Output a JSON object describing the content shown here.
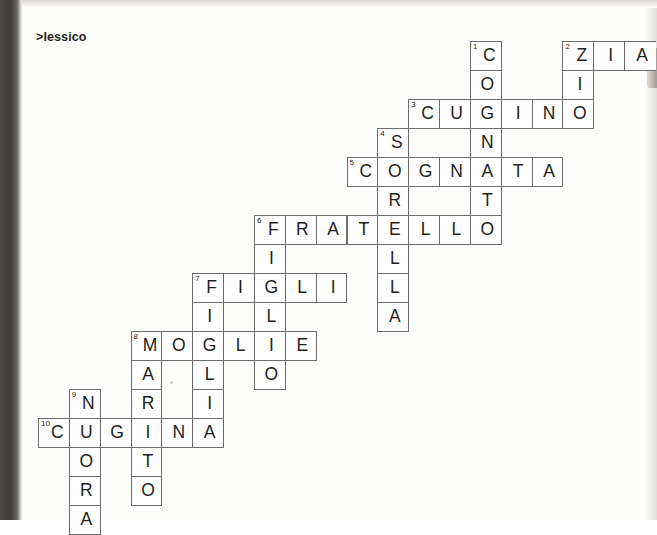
{
  "page": {
    "heading": ">lessico",
    "background_color": "#ffffff",
    "ink_color": "#231f20",
    "cell_border_color": "#6d6d6d"
  },
  "crossword": {
    "cell_width": 30.85,
    "cell_height": 29,
    "origin_x": 38,
    "origin_y": 41,
    "columns": 20,
    "rows": 17,
    "across_entries": [
      {
        "number": "2",
        "answer": "ZIA",
        "row": 0,
        "col": 17,
        "clipped_right": true
      },
      {
        "number": "3",
        "answer": "CUGINO",
        "row": 2,
        "col": 12
      },
      {
        "number": "5",
        "answer": "COGNATA",
        "row": 4,
        "col": 10
      },
      {
        "number": "6",
        "answer": "FRATELLO",
        "row": 6,
        "col": 7
      },
      {
        "number": "7",
        "answer": "FIGLI",
        "row": 8,
        "col": 5
      },
      {
        "number": "8",
        "answer": "MOGLIE",
        "row": 10,
        "col": 3
      },
      {
        "number": "10",
        "answer": "CUGINA",
        "row": 13,
        "col": 0
      }
    ],
    "down_entries": [
      {
        "number": "1",
        "answer": "COGNATO",
        "row": 0,
        "col": 14
      },
      {
        "number": "2",
        "answer": "ZIO",
        "row": 0,
        "col": 17
      },
      {
        "number": "4",
        "answer": "SORELLA",
        "row": 3,
        "col": 11
      },
      {
        "number": "6",
        "answer": "FIGLIA",
        "row": 6,
        "col": 7
      },
      {
        "number": "7",
        "answer": "FIGLIO",
        "row": 8,
        "col": 7
      },
      {
        "number": "8",
        "answer": "MARITO",
        "row": 10,
        "col": 3
      },
      {
        "number": "9",
        "answer": "NUORA",
        "row": 12,
        "col": 1
      }
    ],
    "cells": [
      {
        "row": 0,
        "col": 14,
        "letter": "C",
        "number": "1"
      },
      {
        "row": 0,
        "col": 17,
        "letter": "Z",
        "number": "2"
      },
      {
        "row": 0,
        "col": 18,
        "letter": "I"
      },
      {
        "row": 0,
        "col": 19,
        "letter": "A",
        "clipped": true
      },
      {
        "row": 1,
        "col": 14,
        "letter": "O"
      },
      {
        "row": 1,
        "col": 17,
        "letter": "I"
      },
      {
        "row": 2,
        "col": 12,
        "letter": "C",
        "number": "3"
      },
      {
        "row": 2,
        "col": 13,
        "letter": "U"
      },
      {
        "row": 2,
        "col": 14,
        "letter": "G"
      },
      {
        "row": 2,
        "col": 15,
        "letter": "I"
      },
      {
        "row": 2,
        "col": 16,
        "letter": "N"
      },
      {
        "row": 2,
        "col": 17,
        "letter": "O"
      },
      {
        "row": 3,
        "col": 11,
        "letter": "S",
        "number": "4"
      },
      {
        "row": 3,
        "col": 14,
        "letter": "N"
      },
      {
        "row": 4,
        "col": 10,
        "letter": "C",
        "number": "5"
      },
      {
        "row": 4,
        "col": 11,
        "letter": "O"
      },
      {
        "row": 4,
        "col": 12,
        "letter": "G"
      },
      {
        "row": 4,
        "col": 13,
        "letter": "N"
      },
      {
        "row": 4,
        "col": 14,
        "letter": "A"
      },
      {
        "row": 4,
        "col": 15,
        "letter": "T"
      },
      {
        "row": 4,
        "col": 16,
        "letter": "A"
      },
      {
        "row": 5,
        "col": 11,
        "letter": "R"
      },
      {
        "row": 5,
        "col": 14,
        "letter": "T"
      },
      {
        "row": 6,
        "col": 7,
        "letter": "F",
        "number": "6"
      },
      {
        "row": 6,
        "col": 8,
        "letter": "R"
      },
      {
        "row": 6,
        "col": 9,
        "letter": "A"
      },
      {
        "row": 6,
        "col": 10,
        "letter": "T"
      },
      {
        "row": 6,
        "col": 11,
        "letter": "E"
      },
      {
        "row": 6,
        "col": 12,
        "letter": "L"
      },
      {
        "row": 6,
        "col": 13,
        "letter": "L"
      },
      {
        "row": 6,
        "col": 14,
        "letter": "O"
      },
      {
        "row": 7,
        "col": 7,
        "letter": "I"
      },
      {
        "row": 7,
        "col": 11,
        "letter": "L"
      },
      {
        "row": 8,
        "col": 5,
        "letter": "F",
        "number": "7"
      },
      {
        "row": 8,
        "col": 6,
        "letter": "I"
      },
      {
        "row": 8,
        "col": 7,
        "letter": "G"
      },
      {
        "row": 8,
        "col": 8,
        "letter": "L"
      },
      {
        "row": 8,
        "col": 9,
        "letter": "I"
      },
      {
        "row": 8,
        "col": 11,
        "letter": "L"
      },
      {
        "row": 9,
        "col": 5,
        "letter": "I"
      },
      {
        "row": 9,
        "col": 7,
        "letter": "L"
      },
      {
        "row": 9,
        "col": 11,
        "letter": "A"
      },
      {
        "row": 10,
        "col": 3,
        "letter": "M",
        "number": "8"
      },
      {
        "row": 10,
        "col": 4,
        "letter": "O"
      },
      {
        "row": 10,
        "col": 5,
        "letter": "G"
      },
      {
        "row": 10,
        "col": 6,
        "letter": "L"
      },
      {
        "row": 10,
        "col": 7,
        "letter": "I"
      },
      {
        "row": 10,
        "col": 8,
        "letter": "E"
      },
      {
        "row": 11,
        "col": 3,
        "letter": "A"
      },
      {
        "row": 11,
        "col": 5,
        "letter": "L"
      },
      {
        "row": 11,
        "col": 7,
        "letter": "O"
      },
      {
        "row": 12,
        "col": 1,
        "letter": "N",
        "number": "9"
      },
      {
        "row": 12,
        "col": 3,
        "letter": "R"
      },
      {
        "row": 12,
        "col": 5,
        "letter": "I"
      },
      {
        "row": 13,
        "col": 0,
        "letter": "C",
        "number": "10"
      },
      {
        "row": 13,
        "col": 1,
        "letter": "U"
      },
      {
        "row": 13,
        "col": 2,
        "letter": "G"
      },
      {
        "row": 13,
        "col": 3,
        "letter": "I"
      },
      {
        "row": 13,
        "col": 4,
        "letter": "N"
      },
      {
        "row": 13,
        "col": 5,
        "letter": "A"
      },
      {
        "row": 14,
        "col": 1,
        "letter": "O"
      },
      {
        "row": 14,
        "col": 3,
        "letter": "T"
      },
      {
        "row": 15,
        "col": 1,
        "letter": "R"
      },
      {
        "row": 15,
        "col": 3,
        "letter": "O"
      },
      {
        "row": 16,
        "col": 1,
        "letter": "A"
      }
    ]
  }
}
